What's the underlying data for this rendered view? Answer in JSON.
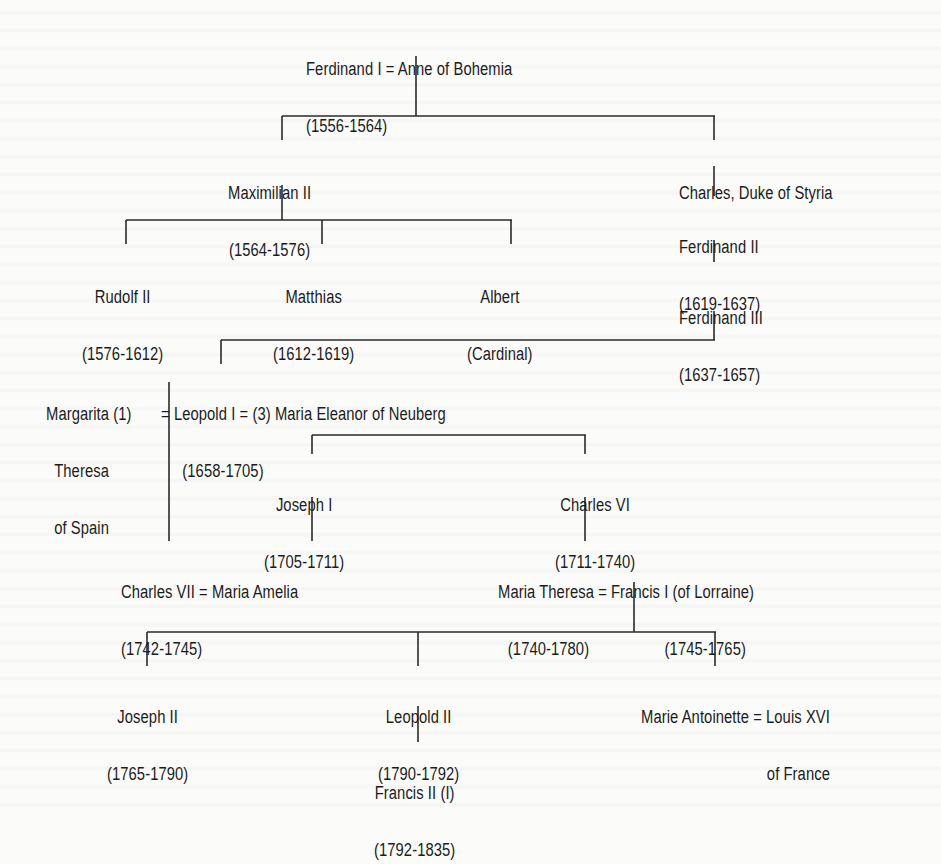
{
  "diagram": {
    "type": "family-tree",
    "title": "",
    "nodes": {
      "ferdinand_i": {
        "line1": "Ferdinand I = Anne of Bohemia",
        "line2": "(1556-1564)"
      },
      "maximilian_ii": {
        "line1": "Maximilian II",
        "line2": "(1564-1576)"
      },
      "charles_styria": {
        "line1": "Charles, Duke of Styria"
      },
      "ferdinand_ii": {
        "line1": "Ferdinand II",
        "line2": "(1619-1637)"
      },
      "rudolf_ii": {
        "line1": "Rudolf II",
        "line2": "(1576-1612)"
      },
      "matthias": {
        "line1": "Matthias",
        "line2": "(1612-1619)"
      },
      "albert": {
        "line1": "Albert",
        "line2": "(Cardinal)"
      },
      "ferdinand_iii": {
        "line1": "Ferdinand III",
        "line2": "(1637-1657)"
      },
      "margarita": {
        "line1": "Margarita (1)",
        "line2": "Theresa",
        "line3": "of Spain"
      },
      "leopold_i": {
        "line1": "= Leopold I = (3) Maria Eleanor of Neuberg",
        "line2": "(1658-1705)"
      },
      "joseph_i": {
        "line1": "Joseph I",
        "line2": "(1705-1711)"
      },
      "charles_vi": {
        "line1": "Charles VI",
        "line2": "(1711-1740)"
      },
      "charles_vii": {
        "line1": "Charles VII = Maria Amelia",
        "line2": "(1742-1745)"
      },
      "maria_theresa": {
        "line1": "Maria Theresa = Francis I (of Lorraine)",
        "line2": "(1740-1780)",
        "line2b": "(1745-1765)"
      },
      "joseph_ii": {
        "line1": "Joseph II",
        "line2": "(1765-1790)"
      },
      "leopold_ii": {
        "line1": "Leopold II",
        "line2": "(1790-1792)"
      },
      "marie_antoinette": {
        "line1": "Marie Antoinette = Louis XVI",
        "line2": "of France"
      },
      "francis_ii": {
        "line1": "Francis II (I)",
        "line2": "(1792-1835)"
      }
    },
    "edges": [
      [
        "ferdinand_i",
        "maximilian_ii"
      ],
      [
        "ferdinand_i",
        "charles_styria"
      ],
      [
        "charles_styria",
        "ferdinand_ii"
      ],
      [
        "ferdinand_ii",
        "ferdinand_iii"
      ],
      [
        "maximilian_ii",
        "rudolf_ii"
      ],
      [
        "maximilian_ii",
        "matthias"
      ],
      [
        "maximilian_ii",
        "albert"
      ],
      [
        "ferdinand_iii",
        "leopold_i"
      ],
      [
        "leopold_i",
        "charles_vii"
      ],
      [
        "joseph_i",
        "charles_vi"
      ],
      [
        "joseph_i",
        "charles_vii"
      ],
      [
        "charles_vi",
        "maria_theresa"
      ],
      [
        "maria_theresa",
        "joseph_ii"
      ],
      [
        "maria_theresa",
        "leopold_ii"
      ],
      [
        "maria_theresa",
        "marie_antoinette"
      ],
      [
        "leopold_ii",
        "francis_ii"
      ]
    ]
  }
}
